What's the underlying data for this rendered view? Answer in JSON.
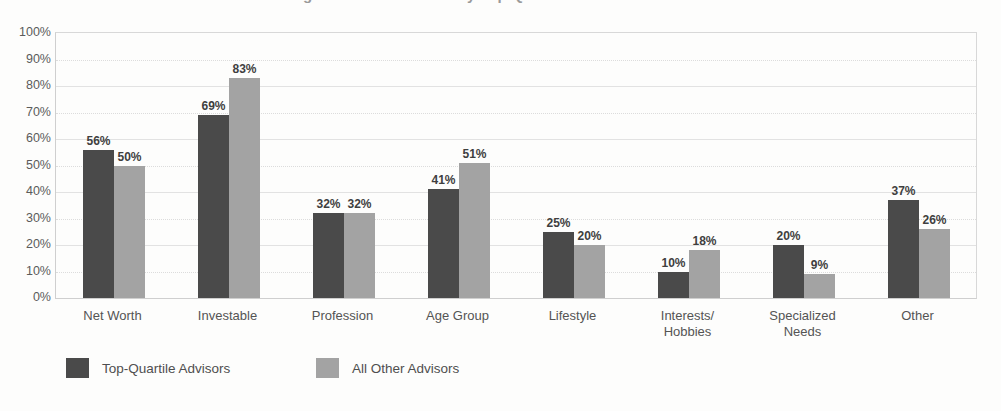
{
  "title": "Segmentation Methods by Top-Quartile and Other Advisors",
  "chart_data": {
    "type": "bar",
    "title": "Segmentation Methods by Top-Quartile and Other Advisors",
    "xlabel": "",
    "ylabel": "",
    "ylim": [
      0,
      100
    ],
    "ytick_labels": [
      "100%",
      "90%",
      "80%",
      "70%",
      "60%",
      "50%",
      "40%",
      "30%",
      "20%",
      "10%",
      "0%"
    ],
    "ytick_values": [
      100,
      90,
      80,
      70,
      60,
      50,
      40,
      30,
      20,
      10,
      0
    ],
    "grid": true,
    "legend_position": "bottom",
    "categories": [
      "Net Worth",
      "Investable",
      "Profession",
      "Age Group",
      "Lifestyle",
      "Interests/\nHobbies",
      "Specialized\nNeeds",
      "Other"
    ],
    "series": [
      {
        "name": "Top-Quartile Advisors",
        "color": "#4a4a4a",
        "values": [
          56,
          69,
          32,
          41,
          25,
          10,
          20,
          37
        ],
        "labels": [
          "56%",
          "69%",
          "32%",
          "41%",
          "25%",
          "10%",
          "20%",
          "37%"
        ]
      },
      {
        "name": "All Other Advisors",
        "color": "#a3a3a3",
        "values": [
          50,
          83,
          32,
          51,
          20,
          18,
          9,
          26
        ],
        "labels": [
          "50%",
          "83%",
          "32%",
          "51%",
          "20%",
          "18%",
          "9%",
          "26%"
        ]
      }
    ]
  }
}
